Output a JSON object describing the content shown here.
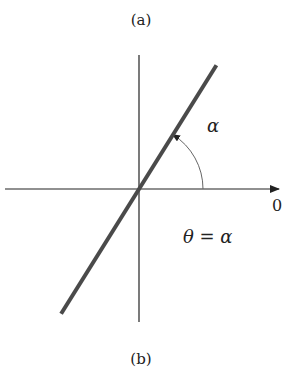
{
  "diagram": {
    "caption_top": "(a)",
    "caption_bottom": "(b)",
    "angle_label": "α",
    "equation_label": "θ = α",
    "axis_end_label": "0",
    "colors": {
      "axis": "#222222",
      "line": "#4a4a4a",
      "arc": "#666666",
      "text": "#222222"
    },
    "line_angle_deg": 58
  }
}
